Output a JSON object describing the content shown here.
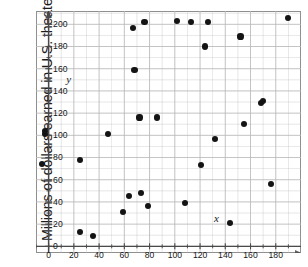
{
  "figure": {
    "ylabel": "Millions of dollars earned in U.S. theaters",
    "y_axis_name": "y",
    "x_axis_name": "x"
  },
  "chart_data": {
    "type": "scatter",
    "title": "",
    "xlabel": "",
    "ylabel": "Millions of dollars earned in U.S. theaters",
    "xlim": [
      -10,
      200
    ],
    "ylim": [
      -6,
      212
    ],
    "xticks": [
      0,
      20,
      40,
      60,
      80,
      100,
      120,
      140,
      160,
      180
    ],
    "yticks": [
      0,
      20,
      40,
      60,
      80,
      100,
      120,
      140,
      160,
      180,
      200
    ],
    "xtick_labels": [
      "0",
      "20",
      "40",
      "60",
      "80",
      "100",
      "120",
      "140",
      "160",
      "180"
    ],
    "ytick_labels": [
      "0",
      "20",
      "40",
      "60",
      "80",
      "100",
      "120",
      "140",
      "160",
      "180",
      "200"
    ],
    "grid": true,
    "grid_minor_step_x": 10,
    "grid_minor_step_y": 10,
    "legend": "none",
    "marker_color": "#141414",
    "grid_color": "#b9b9b9",
    "axis_color": "#4a4a4a",
    "points": [
      {
        "x": -5,
        "y": 74
      },
      {
        "x": -3,
        "y": 101
      },
      {
        "x": -3,
        "y": 104
      },
      {
        "x": 25,
        "y": 13
      },
      {
        "x": 25,
        "y": 78
      },
      {
        "x": 35,
        "y": 9
      },
      {
        "x": 47,
        "y": 101
      },
      {
        "x": 59,
        "y": 31
      },
      {
        "x": 64,
        "y": 45
      },
      {
        "x": 67,
        "y": 197
      },
      {
        "x": 68,
        "y": 159
      },
      {
        "x": 72,
        "y": 116
      },
      {
        "x": 73,
        "y": 48
      },
      {
        "x": 76,
        "y": 202
      },
      {
        "x": 79,
        "y": 36
      },
      {
        "x": 86,
        "y": 116
      },
      {
        "x": 102,
        "y": 203
      },
      {
        "x": 108,
        "y": 39
      },
      {
        "x": 113,
        "y": 202
      },
      {
        "x": 121,
        "y": 73
      },
      {
        "x": 124,
        "y": 180
      },
      {
        "x": 126,
        "y": 202
      },
      {
        "x": 132,
        "y": 97
      },
      {
        "x": 144,
        "y": 21
      },
      {
        "x": 152,
        "y": 189
      },
      {
        "x": 155,
        "y": 110
      },
      {
        "x": 168,
        "y": 129
      },
      {
        "x": 170,
        "y": 131
      },
      {
        "x": 176,
        "y": 56
      },
      {
        "x": 190,
        "y": 206
      }
    ]
  }
}
